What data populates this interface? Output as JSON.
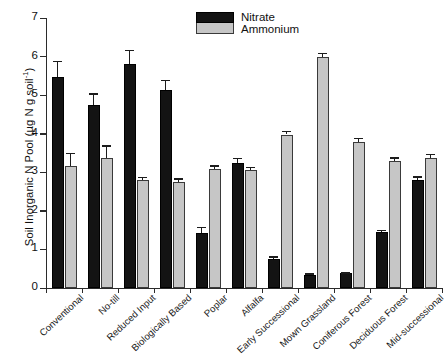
{
  "chart_data": {
    "type": "bar",
    "title": "",
    "xlabel": "",
    "ylabel": "Soil Inorganic N Pool (µg N g soil",
    "ylabel_exponent": "-1",
    "ylabel_suffix": ")",
    "ylim": [
      0,
      7
    ],
    "yticks": [
      0,
      1,
      2,
      3,
      4,
      5,
      6,
      7
    ],
    "ytick_labels": [
      "0",
      "1",
      "2",
      "3",
      "4",
      "5",
      "6",
      "7"
    ],
    "grid": false,
    "legend_position": "top-right",
    "categories": [
      "Conventional",
      "No-till",
      "Reduced Input",
      "Biologically Based",
      "Poplar",
      "Alfalfa",
      "Early Successional",
      "Mown Grassland",
      "Coniferous Forest",
      "Deciduous Forest",
      "Mid-successional"
    ],
    "series": [
      {
        "name": "Nitrate",
        "color": "#131313",
        "values": [
          5.47,
          4.75,
          5.81,
          5.13,
          1.42,
          3.25,
          0.75,
          0.35,
          0.38,
          1.45,
          2.8
        ],
        "errors": [
          0.42,
          0.3,
          0.36,
          0.27,
          0.17,
          0.13,
          0.07,
          0.03,
          0.03,
          0.06,
          0.1
        ]
      },
      {
        "name": "Ammonium",
        "color": "#c6c6c6",
        "values": [
          3.16,
          3.37,
          2.79,
          2.74,
          3.08,
          3.06,
          3.98,
          6.0,
          3.78,
          3.3,
          3.38
        ],
        "errors": [
          0.35,
          0.33,
          0.1,
          0.1,
          0.1,
          0.09,
          0.09,
          0.1,
          0.11,
          0.09,
          0.1
        ]
      }
    ]
  },
  "legend": {
    "entries": [
      "Nitrate",
      "Ammonium"
    ]
  }
}
